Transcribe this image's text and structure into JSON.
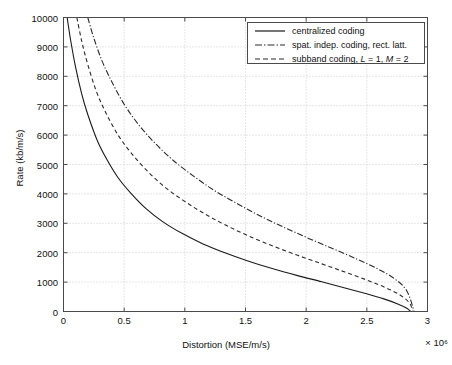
{
  "chart_data": {
    "type": "line",
    "title": "",
    "xlabel": "Distortion (MSE/m/s)",
    "ylabel": "Rate (kb/m/s)",
    "x_multiplier": "× 10⁶",
    "xlim": [
      0,
      3000000
    ],
    "ylim": [
      0,
      10000
    ],
    "x_ticks": [
      "0",
      "0.5",
      "1",
      "1.5",
      "2",
      "2.5",
      "3"
    ],
    "x_tick_values": [
      0,
      500000,
      1000000,
      1500000,
      2000000,
      2500000,
      3000000
    ],
    "y_ticks": [
      "0",
      "1000",
      "2000",
      "3000",
      "4000",
      "5000",
      "6000",
      "7000",
      "8000",
      "9000",
      "10000"
    ],
    "y_tick_values": [
      0,
      1000,
      2000,
      3000,
      4000,
      5000,
      6000,
      7000,
      8000,
      9000,
      10000
    ],
    "grid": true,
    "grid_style": "dotted",
    "legend_position": "top-right",
    "series": [
      {
        "name": "centralized coding",
        "style": "solid",
        "color": "#1a1a1a",
        "x": [
          30000,
          60000,
          100000,
          150000,
          200000,
          280000,
          360000,
          450000,
          560000,
          680000,
          820000,
          980000,
          1150000,
          1330000,
          1520000,
          1720000,
          1930000,
          2130000,
          2320000,
          2490000,
          2640000,
          2760000,
          2830000,
          2860000
        ],
        "y": [
          10000,
          9200,
          8300,
          7400,
          6700,
          5800,
          5150,
          4550,
          4000,
          3500,
          3050,
          2650,
          2300,
          2000,
          1720,
          1460,
          1220,
          1010,
          800,
          610,
          430,
          250,
          110,
          0
        ]
      },
      {
        "name": "subband coding, L = 1, M = 2",
        "style": "dashed",
        "color": "#2a2a2a",
        "x": [
          110000,
          150000,
          200000,
          270000,
          350000,
          450000,
          560000,
          690000,
          830000,
          990000,
          1160000,
          1340000,
          1530000,
          1730000,
          1930000,
          2130000,
          2320000,
          2500000,
          2650000,
          2770000,
          2850000,
          2880000
        ],
        "y": [
          10000,
          9200,
          8400,
          7500,
          6750,
          6000,
          5380,
          4780,
          4250,
          3770,
          3330,
          2930,
          2560,
          2220,
          1910,
          1620,
          1340,
          1070,
          820,
          570,
          300,
          0
        ]
      },
      {
        "name": "spat. indep. coding, rect. latt.",
        "style": "dashdot",
        "color": "#2a2a2a",
        "x": [
          200000,
          250000,
          320000,
          400000,
          500000,
          620000,
          760000,
          910000,
          1080000,
          1250000,
          1440000,
          1630000,
          1830000,
          2030000,
          2230000,
          2420000,
          2590000,
          2730000,
          2830000,
          2890000
        ],
        "y": [
          10000,
          9300,
          8500,
          7800,
          7050,
          6350,
          5700,
          5120,
          4580,
          4100,
          3650,
          3230,
          2840,
          2470,
          2120,
          1780,
          1450,
          1110,
          700,
          0
        ]
      }
    ]
  },
  "legend": {
    "items": [
      {
        "label": "centralized coding",
        "style": "solid"
      },
      {
        "label": "spat. indep. coding, rect. latt.",
        "style": "dashdot"
      },
      {
        "label_pre": "subband coding, ",
        "label_L": "L",
        "label_mid": " = 1, ",
        "label_M": "M",
        "label_post": " = 2",
        "style": "dashed"
      }
    ]
  },
  "axes": {
    "x_title": "Distortion (MSE/m/s)",
    "y_title": "Rate (kb/m/s)",
    "x_exponent": "× 10⁶"
  }
}
